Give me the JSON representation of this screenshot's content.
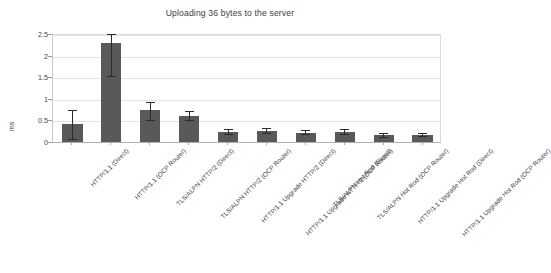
{
  "chart_data": {
    "type": "bar",
    "title": "Uploading 36 bytes to the server",
    "xlabel": "",
    "ylabel": "ms",
    "ylim": [
      0,
      2.5
    ],
    "grid": true,
    "legend": "none",
    "yticks": [
      "0",
      "0.5",
      "1",
      "1.5",
      "2",
      "2.5"
    ],
    "ytick_values": [
      0,
      0.5,
      1,
      1.5,
      2,
      2.5
    ],
    "categories": [
      "HTTP/1.1 (Direct)",
      "HTTP/1.1 (OCP Router)",
      "TLS/ALPN HTTP/2 (Direct)",
      "TLS/ALPN HTTP/2 (OCP Router)",
      "HTTP/1.1 Upgrade HTTP/2 (Direct)",
      "HTTP/1.1 Upgrade HTTP/2 (OCP Router)",
      "TLS/ALPN Hot Rod (Direct)",
      "TLS/ALPN Hot Rod (OCP Router)",
      "HTTP/1.1 Upgrade Hot Rod (Direct)",
      "HTTP/1.1 Upgrade Hot Rod (OCP Router)"
    ],
    "values": [
      0.42,
      2.3,
      0.74,
      0.61,
      0.24,
      0.26,
      0.22,
      0.24,
      0.16,
      0.16
    ],
    "error_low": [
      0.07,
      1.53,
      0.51,
      0.5,
      0.19,
      0.21,
      0.18,
      0.19,
      0.12,
      0.13
    ],
    "error_high": [
      0.73,
      2.5,
      0.93,
      0.72,
      0.3,
      0.32,
      0.27,
      0.3,
      0.21,
      0.2
    ],
    "bar_color": "#595959",
    "error_color": "#2b2b2b",
    "grid_color": "#e4e4e4",
    "background": "#ffffff"
  }
}
